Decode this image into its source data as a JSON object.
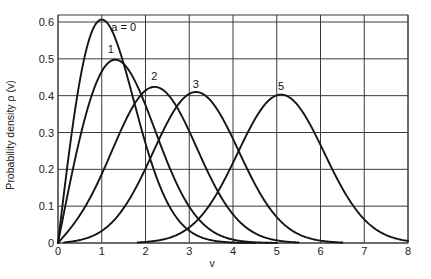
{
  "chart_data": {
    "type": "line",
    "title": "",
    "xlabel": "v",
    "ylabel": "Probability density ρ (v)",
    "xlim": [
      0,
      8
    ],
    "ylim": [
      0,
      0.6
    ],
    "grid": true,
    "x_ticks": [
      "0",
      "1",
      "2",
      "3",
      "4",
      "5",
      "6",
      "7",
      "8"
    ],
    "y_ticks": [
      "0",
      "0.1",
      "0.2",
      "0.3",
      "0.4",
      "0.5",
      "0.6"
    ],
    "legend": "inline labels near curve peaks",
    "series": [
      {
        "name": "a = 0",
        "label": "a = 0",
        "peak": {
          "v": 1.0,
          "density": 0.607
        },
        "x": [
          0,
          0.25,
          0.5,
          0.75,
          1,
          1.25,
          1.5,
          1.75,
          2,
          2.25,
          2.5,
          2.75,
          3,
          3.25,
          3.5,
          4,
          4.5
        ],
        "values": [
          0,
          0.242,
          0.441,
          0.566,
          0.607,
          0.573,
          0.487,
          0.379,
          0.271,
          0.179,
          0.11,
          0.062,
          0.033,
          0.016,
          0.008,
          0.001,
          0.0
        ]
      },
      {
        "name": "a = 1",
        "label": "1",
        "peak": {
          "v": 1.3,
          "density": 0.5
        },
        "x": [
          0,
          0.25,
          0.5,
          0.75,
          1,
          1.25,
          1.5,
          1.75,
          2,
          2.25,
          2.5,
          2.75,
          3,
          3.5,
          4,
          4.5,
          5
        ],
        "values": [
          0,
          0.149,
          0.289,
          0.404,
          0.478,
          0.501,
          0.473,
          0.405,
          0.316,
          0.226,
          0.148,
          0.089,
          0.05,
          0.012,
          0.002,
          0.0,
          0.0
        ]
      },
      {
        "name": "a = 2",
        "label": "2",
        "peak": {
          "v": 2.2,
          "density": 0.425
        },
        "x": [
          0,
          0.5,
          1,
          1.5,
          2,
          2.25,
          2.5,
          3,
          3.5,
          4,
          4.5,
          5,
          5.5
        ],
        "values": [
          0,
          0.087,
          0.192,
          0.315,
          0.412,
          0.424,
          0.408,
          0.307,
          0.172,
          0.072,
          0.022,
          0.005,
          0.0
        ]
      },
      {
        "name": "a = 3",
        "label": "3",
        "peak": {
          "v": 3.15,
          "density": 0.405
        },
        "x": [
          0,
          0.5,
          1,
          1.5,
          2,
          2.5,
          3,
          3.25,
          3.5,
          4,
          4.5,
          5,
          5.5,
          6,
          6.5
        ],
        "values": [
          0,
          0.012,
          0.046,
          0.118,
          0.229,
          0.345,
          0.403,
          0.405,
          0.386,
          0.29,
          0.166,
          0.074,
          0.025,
          0.007,
          0.0
        ]
      },
      {
        "name": "a = 5",
        "label": "5",
        "peak": {
          "v": 5.1,
          "density": 0.4
        },
        "x": [
          0,
          1,
          1.5,
          2,
          2.5,
          3,
          3.5,
          4,
          4.5,
          5,
          5.25,
          5.5,
          6,
          6.5,
          7,
          7.5,
          8
        ],
        "values": [
          0,
          0.0003,
          0.004,
          0.019,
          0.058,
          0.13,
          0.228,
          0.322,
          0.385,
          0.401,
          0.396,
          0.377,
          0.301,
          0.2,
          0.11,
          0.05,
          0.018
        ]
      }
    ]
  },
  "axes": {
    "xlabel": "v",
    "ylabel": "Probability density ρ (v)"
  },
  "style": {
    "curve_color": "#151515",
    "grid_color": "#3a3a3a",
    "background": "#ffffff"
  }
}
